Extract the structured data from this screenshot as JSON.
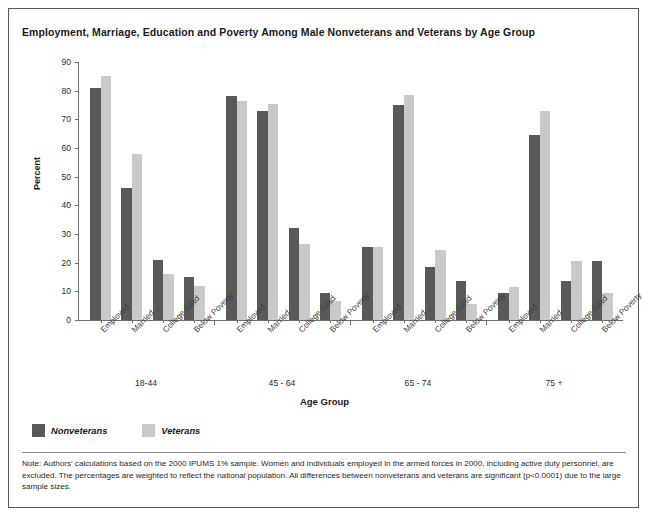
{
  "chart_data": {
    "type": "bar",
    "title": "Employment, Marriage, Education and Poverty Among Male Nonveterans and Veterans by Age Group",
    "xlabel": "Age Group",
    "ylabel": "Percent",
    "ylim": [
      0,
      90
    ],
    "yticks": [
      0,
      10,
      20,
      30,
      40,
      50,
      60,
      70,
      80,
      90
    ],
    "grid": false,
    "legend_position": "bottom-left",
    "categories": [
      "Employed",
      "Married",
      "College Grad",
      "Below Poverty"
    ],
    "groups": [
      {
        "label": "18-44",
        "categories": [
          "Employed",
          "Married",
          "College Grad",
          "Below Poverty"
        ],
        "Nonveterans": [
          81,
          46,
          21,
          15
        ],
        "Veterans": [
          85,
          58,
          16,
          12
        ]
      },
      {
        "label": "45 - 64",
        "categories": [
          "Employed",
          "Married",
          "College Grad",
          "Below Poverty"
        ],
        "Nonveterans": [
          78,
          73,
          32,
          9.5
        ],
        "Veterans": [
          76.5,
          75.5,
          26.5,
          6.5
        ]
      },
      {
        "label": "65 - 74",
        "categories": [
          "Employed",
          "Married",
          "College Grad",
          "Below Poverty"
        ],
        "Nonveterans": [
          25.5,
          75,
          18.5,
          13.5
        ],
        "Veterans": [
          25.5,
          78.5,
          24.5,
          5.5
        ]
      },
      {
        "label": "75 +",
        "categories": [
          "Employed",
          "Married",
          "College Grad",
          "Below Poverty"
        ],
        "Nonveterans": [
          9.5,
          64.5,
          13.5,
          20.5
        ],
        "Veterans": [
          11.5,
          73,
          20.5,
          9.5
        ]
      }
    ],
    "series": [
      {
        "name": "Nonveterans",
        "color": "#59595b"
      },
      {
        "name": "Veterans",
        "color": "#c9c9c8"
      }
    ]
  },
  "legend": {
    "items": [
      {
        "label": "Nonveterans",
        "color": "#59595b"
      },
      {
        "label": "Veterans",
        "color": "#c9c9c8"
      }
    ]
  },
  "note": {
    "text": "Note: Authors' calculations based on the 2000 IPUMS 1% sample. Women and individuals employed in the armed forces in 2000, including active duty personnel, are excluded. The percentages are weighted to reflect the national population. All differences between nonveterans and veterans are significant (p<0.0001) due to the large sample sizes."
  }
}
